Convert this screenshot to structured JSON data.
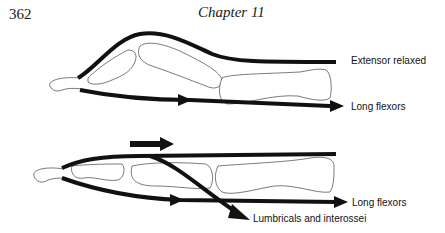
{
  "header": {
    "page_number": "362",
    "chapter_title": "Chapter 11"
  },
  "figure": {
    "top_panel": {
      "labels": {
        "extensor": "Extensor relaxed",
        "flexors": "Long flexors"
      }
    },
    "bottom_panel": {
      "labels": {
        "flexors": "Long flexors",
        "lumbricals": "Lumbricals and interossei"
      }
    }
  }
}
